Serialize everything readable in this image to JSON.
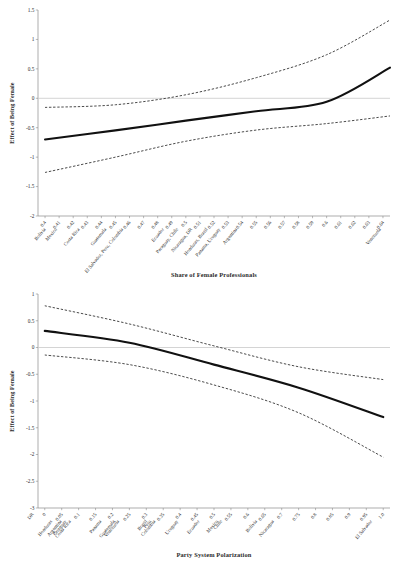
{
  "figure": {
    "panels": [
      "top",
      "bottom"
    ],
    "background_color": "#ffffff",
    "line_color": "#111111",
    "ci_color": "#2a2a2a",
    "axis_color": "#8a8a8a",
    "zero_line_color": "#c9c9c9"
  },
  "chart_data": [
    {
      "type": "line",
      "panel": "top",
      "title": "",
      "xlabel": "Share of Female Professionals",
      "ylabel": "Effect of Being Female",
      "xlim": [
        0.395,
        0.645
      ],
      "ylim": [
        -2,
        1.5
      ],
      "grid": false,
      "legend": "none",
      "xticks": [
        0.4,
        0.41,
        0.42,
        0.43,
        0.44,
        0.45,
        0.46,
        0.47,
        0.48,
        0.49,
        0.5,
        0.51,
        0.52,
        0.53,
        0.54,
        0.55,
        0.56,
        0.57,
        0.58,
        0.59,
        0.6,
        0.61,
        0.62,
        0.63,
        0.64
      ],
      "xtick_labels": [
        "0.4",
        "0.41",
        "0.42",
        "0.43",
        "0.44",
        "0.45",
        "0.46",
        "0.47",
        "0.48",
        "0.49",
        "0.5",
        "0.51",
        "0.52",
        "0.53",
        "0.54",
        "0.55",
        "0.56",
        "0.57",
        "0.58",
        "0.59",
        "0.6",
        "0.61",
        "0.62",
        "0.63",
        "0.64"
      ],
      "yticks": [
        1.5,
        1,
        0.5,
        0,
        -0.5,
        -1,
        -1.5,
        -2
      ],
      "ytick_labels": [
        "1.5",
        "1",
        "0.5",
        "0",
        "-0.5",
        "-1",
        "-1.5",
        "-2"
      ],
      "country_annotations": [
        {
          "label": "Bolivia",
          "x": 0.4
        },
        {
          "label": "Mexico",
          "x": 0.408
        },
        {
          "label": "Costa Rica",
          "x": 0.424
        },
        {
          "label": "Guatemala",
          "x": 0.443
        },
        {
          "label": "El Salvador, Peru, Colombia",
          "x": 0.455
        },
        {
          "label": "Ecuador",
          "x": 0.484
        },
        {
          "label": "Paraguay, Chile",
          "x": 0.494
        },
        {
          "label": "Nicaragua, DR",
          "x": 0.504
        },
        {
          "label": "Honduras, Brazil",
          "x": 0.515
        },
        {
          "label": "Panama, Uruguay",
          "x": 0.524
        },
        {
          "label": "Argentina",
          "x": 0.536
        },
        {
          "label": "Venezuela",
          "x": 0.638
        }
      ],
      "series": [
        {
          "name": "Marginal effect",
          "style": "solid",
          "x": [
            0.4,
            0.45,
            0.5,
            0.55,
            0.6,
            0.645
          ],
          "y": [
            -0.7,
            -0.545,
            -0.38,
            -0.22,
            -0.06,
            0.52
          ]
        },
        {
          "name": "Upper 95% CI",
          "style": "dashed",
          "x": [
            0.4,
            0.45,
            0.5,
            0.55,
            0.6,
            0.645
          ],
          "y": [
            -0.155,
            -0.11,
            0.06,
            0.35,
            0.74,
            1.33
          ]
        },
        {
          "name": "Lower 95% CI",
          "style": "dashed",
          "x": [
            0.4,
            0.45,
            0.5,
            0.55,
            0.6,
            0.645
          ],
          "y": [
            -1.26,
            -1.0,
            -0.73,
            -0.54,
            -0.43,
            -0.3
          ]
        }
      ]
    },
    {
      "type": "line",
      "panel": "bottom",
      "title": "",
      "xlabel": "Party System Polarization",
      "ylabel": "Effect of Being Female",
      "xlim": [
        -0.02,
        1.02
      ],
      "ylim": [
        -3,
        1
      ],
      "grid": false,
      "legend": "none",
      "xticks": [
        0,
        0.05,
        0.1,
        0.15,
        0.2,
        0.25,
        0.3,
        0.35,
        0.4,
        0.45,
        0.5,
        0.55,
        0.6,
        0.65,
        0.7,
        0.75,
        0.8,
        0.85,
        0.9,
        0.95,
        1.0
      ],
      "xtick_labels": [
        "0",
        "0.05",
        "0.1",
        "0.15",
        "0.2",
        "0.25",
        "0.3",
        "0.35",
        "0.4",
        "0.45",
        "0.5",
        "0.55",
        "0.6",
        "0.65",
        "0.7",
        "0.75",
        "0.8",
        "0.85",
        "0.9",
        "0.95",
        "1.0"
      ],
      "yticks": [
        1,
        0.5,
        0,
        -0.5,
        -1,
        -1.5,
        -2,
        -2.5,
        -3
      ],
      "ytick_labels": [
        "1",
        "0.5",
        "0",
        "-0.5",
        "-1",
        "-1.5",
        "-2",
        "-2.5",
        "-3"
      ],
      "extra_xtick_label": "DR",
      "country_annotations": [
        {
          "label": "Honduras",
          "x": 0.02
        },
        {
          "label": "Argentina",
          "x": 0.048
        },
        {
          "label": "Paraguay",
          "x": 0.062
        },
        {
          "label": "Costa Rica",
          "x": 0.075
        },
        {
          "label": "Panama",
          "x": 0.165
        },
        {
          "label": "Guatemala",
          "x": 0.205
        },
        {
          "label": "Venezuela",
          "x": 0.218
        },
        {
          "label": "Brazil",
          "x": 0.3
        },
        {
          "label": "Peru",
          "x": 0.312
        },
        {
          "label": "Colombia",
          "x": 0.325
        },
        {
          "label": "Uruguay",
          "x": 0.392
        },
        {
          "label": "Ecuador",
          "x": 0.455
        },
        {
          "label": "Mexico",
          "x": 0.51
        },
        {
          "label": "Chile",
          "x": 0.522
        },
        {
          "label": "Bolivia",
          "x": 0.625
        },
        {
          "label": "Nicaragua",
          "x": 0.675
        },
        {
          "label": "El Salvador",
          "x": 0.965
        }
      ],
      "series": [
        {
          "name": "Marginal effect",
          "style": "solid",
          "x": [
            0,
            0.25,
            0.5,
            0.75,
            1.0
          ],
          "y": [
            0.31,
            0.09,
            -0.32,
            -0.75,
            -1.3
          ]
        },
        {
          "name": "Upper 95% CI",
          "style": "dashed",
          "x": [
            0,
            0.25,
            0.5,
            0.75,
            1.0
          ],
          "y": [
            0.78,
            0.44,
            0.03,
            -0.36,
            -0.6
          ]
        },
        {
          "name": "Lower 95% CI",
          "style": "dashed",
          "x": [
            0,
            0.25,
            0.5,
            0.75,
            1.0
          ],
          "y": [
            -0.14,
            -0.32,
            -0.7,
            -1.22,
            -2.05
          ]
        }
      ]
    }
  ]
}
